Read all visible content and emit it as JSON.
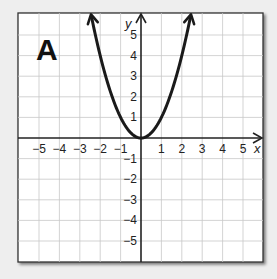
{
  "panel": {
    "label": "A"
  },
  "chart_data": {
    "type": "line",
    "title": "A",
    "xlabel": "x",
    "ylabel": "y",
    "xlim": [
      -6,
      6
    ],
    "ylim": [
      -6,
      6
    ],
    "grid": true,
    "x_ticks": [
      "-5",
      "-4",
      "-3",
      "-2",
      "-1",
      "1",
      "2",
      "3",
      "4",
      "5"
    ],
    "y_ticks": [
      "5",
      "4",
      "3",
      "2",
      "1",
      "-1",
      "-2",
      "-3",
      "-4",
      "-5"
    ],
    "series": [
      {
        "name": "y = x^2",
        "x": [
          -2.45,
          -2,
          -1.5,
          -1,
          -0.5,
          0,
          0.5,
          1,
          1.5,
          2,
          2.45
        ],
        "y": [
          6,
          4,
          2.25,
          1,
          0.25,
          0,
          0.25,
          1,
          2.25,
          4,
          6
        ],
        "arrows_at_ends": true
      }
    ]
  }
}
